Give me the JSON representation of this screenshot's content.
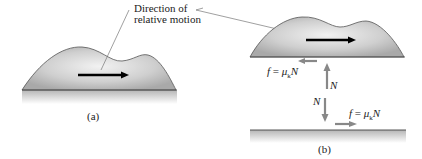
{
  "callout": {
    "line1": "Direction of",
    "line2": "relative motion"
  },
  "panel_a": {
    "caption": "(a)"
  },
  "panel_b": {
    "caption": "(b)",
    "friction_on_block": {
      "f": "f",
      "eq": "=",
      "mu": "μ",
      "k": "k",
      "N": "N"
    },
    "normal_up": "N",
    "normal_down": "N",
    "friction_on_ground": {
      "f": "f",
      "eq": "=",
      "mu": "μ",
      "k": "k",
      "N": "N"
    }
  },
  "colors": {
    "block": "#bdbdbd",
    "arrow": "#000000",
    "force_arrow": "#808080",
    "ground": "#c8c8c8"
  }
}
